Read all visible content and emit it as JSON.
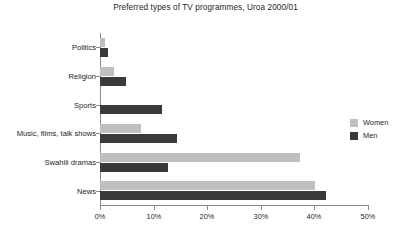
{
  "chart_data": {
    "type": "bar",
    "orientation": "horizontal",
    "title": "Preferred types of TV programmes, Uroa 2000/01",
    "xlabel": "",
    "ylabel": "",
    "xlim": [
      0,
      50
    ],
    "xticks": [
      "0%",
      "10%",
      "20%",
      "30%",
      "40%",
      "50%"
    ],
    "xtick_values": [
      0,
      10,
      20,
      30,
      40,
      50
    ],
    "grid": false,
    "legend_position": "right",
    "categories": [
      "Politics",
      "Religion",
      "Sports",
      "Music, films, talk shows",
      "Swahili dramas",
      "News"
    ],
    "series": [
      {
        "name": "Women",
        "color": "#bfbfbf",
        "values": [
          1,
          2.6,
          0,
          7.6,
          37.3,
          40.1
        ]
      },
      {
        "name": "Men",
        "color": "#3a3a3a",
        "values": [
          1.4,
          4.9,
          11.6,
          14.4,
          12.7,
          42.1
        ]
      }
    ]
  },
  "legend": {
    "items": [
      {
        "label": "Women"
      },
      {
        "label": "Men"
      }
    ]
  },
  "axis": {
    "x_labels": [
      "0%",
      "10%",
      "20%",
      "30%",
      "40%",
      "50%"
    ]
  }
}
